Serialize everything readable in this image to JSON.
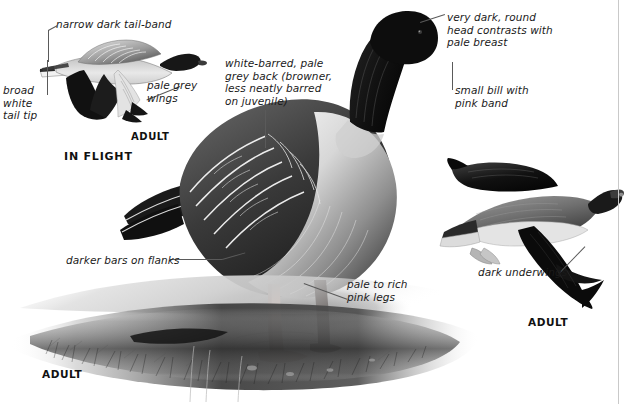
{
  "plate": {
    "subject": "Pink-footed Goose field-guide plate",
    "width": 631,
    "height": 404,
    "background_color": "#ffffff",
    "rule_color": "#c9c9c9",
    "ink_color": "#1a1a1a"
  },
  "callouts": [
    {
      "id": "narrow-dark-tail-band",
      "text": "narrow dark tail-band",
      "x": 56,
      "y": 18
    },
    {
      "id": "broad-white-tail-tip",
      "text": "broad\nwhite\ntail tip",
      "x": 3,
      "y": 84
    },
    {
      "id": "pale-grey-wings",
      "text": "pale grey\nwings",
      "x": 147,
      "y": 79
    },
    {
      "id": "white-barred-pale-grey-back",
      "text": "white-barred, pale\ngrey back (browner,\nless neatly barred\non juvenile)",
      "x": 225,
      "y": 57
    },
    {
      "id": "very-dark-round-head",
      "text": "very dark, round\nhead contrasts with\npale breast",
      "x": 447,
      "y": 11
    },
    {
      "id": "small-bill-with-pink-band",
      "text": "small bill with\npink band",
      "x": 455,
      "y": 84
    },
    {
      "id": "darker-bars-on-flanks",
      "text": "darker bars on flanks",
      "x": 66,
      "y": 254
    },
    {
      "id": "pale-to-rich-pink-legs",
      "text": "pale to rich\npink legs",
      "x": 347,
      "y": 278
    },
    {
      "id": "dark-underwings",
      "text": "dark underwings",
      "x": 478,
      "y": 266
    }
  ],
  "captions": [
    {
      "id": "adult-in-flight-left",
      "text": "ADULT",
      "x": 131,
      "y": 131
    },
    {
      "id": "in-flight-heading",
      "text": "IN FLIGHT",
      "x": 64,
      "y": 150
    },
    {
      "id": "adult-standing",
      "text": "ADULT",
      "x": 42,
      "y": 368
    },
    {
      "id": "adult-in-flight-right",
      "text": "ADULT",
      "x": 528,
      "y": 316
    }
  ],
  "figures": [
    {
      "id": "flying-goose-upper-left",
      "label": "ADULT",
      "pose": "in flight, seen from above/side"
    },
    {
      "id": "standing-goose-centre",
      "label": "ADULT",
      "pose": "standing on ground"
    },
    {
      "id": "flying-goose-lower-right",
      "label": "ADULT",
      "pose": "in flight, underwing visible"
    }
  ]
}
